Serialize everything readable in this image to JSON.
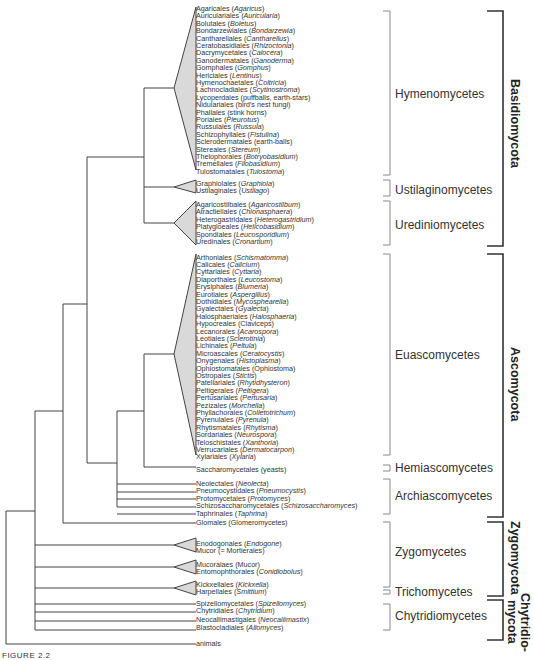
{
  "figure_label": "FIGURE 2.2",
  "colors": {
    "line": "#444444",
    "triangle_fill": "#d9d9d9",
    "bracket_light": "#888888",
    "bracket_dark": "#333333"
  },
  "taxa": [
    {
      "name": "Agaricales",
      "example": "Agaricus",
      "italic": true,
      "y": 9
    },
    {
      "name": "Auriculariales",
      "example": "Auricularia",
      "italic": true,
      "y": 16.4
    },
    {
      "name": "Bolutales",
      "example": "Boletus",
      "italic": true,
      "y": 23.8
    },
    {
      "name": "Bondarzewiales",
      "example": "Bondarzewia",
      "italic": true,
      "y": 31.2
    },
    {
      "name": "Cantharellales",
      "example": "Cantharellus",
      "italic": true,
      "y": 38.6
    },
    {
      "name": "Ceratobasidiales",
      "example": "Rhizoctonia",
      "italic": true,
      "y": 46
    },
    {
      "name": "Dacrymycetales",
      "example": "Calocera",
      "italic": true,
      "y": 53.4
    },
    {
      "name": "Ganodermatales",
      "example": "Ganoderma",
      "italic": true,
      "y": 60.8
    },
    {
      "name": "Gomphales",
      "example": "Gomphus",
      "italic": true,
      "y": 68.2
    },
    {
      "name": "Hericiales",
      "example": "Lentinus",
      "italic": true,
      "y": 75.6
    },
    {
      "name": "Hymenochaetales",
      "example": "Coltricia",
      "italic": true,
      "y": 83
    },
    {
      "name": "Lachnocladiales",
      "example": "Scytinostroma",
      "italic": true,
      "y": 90.4
    },
    {
      "name": "Lycoperdales",
      "example": "puffballs, earth-stars",
      "italic": false,
      "y": 97.8
    },
    {
      "name": "Nidulariales",
      "example": "bird's nest fungi",
      "italic": false,
      "y": 105.2
    },
    {
      "name": "Phallales",
      "example": "stink horns",
      "italic": false,
      "y": 112.6
    },
    {
      "name": "Poriales",
      "example": "Pleurotus",
      "italic": true,
      "y": 120
    },
    {
      "name": "Russulales",
      "example": "Russula",
      "italic": true,
      "y": 127.4
    },
    {
      "name": "Schizophyllales",
      "example": "Fistulina",
      "italic": true,
      "y": 134.8
    },
    {
      "name": "Sclerodermatales",
      "example": "earth-balls",
      "italic": false,
      "y": 142.2
    },
    {
      "name": "Stereales",
      "example": "Stereum",
      "italic": true,
      "y": 149.6
    },
    {
      "name": "Thelophorales",
      "example": "Botryobasidium",
      "italic": true,
      "y": 157
    },
    {
      "name": "Tremellales",
      "example": "Filobasidium",
      "italic": true,
      "y": 164.4
    },
    {
      "name": "Tulostomatales",
      "example": "Tulostoma",
      "italic": true,
      "y": 171.8
    },
    {
      "name": "Graphiolales",
      "example": "Graphiola",
      "italic": true,
      "y": 184
    },
    {
      "name": "Ustilaginales",
      "example": "Ustilago",
      "italic": true,
      "y": 191.4
    },
    {
      "name": "Agaricostilbales",
      "example": "Agaricostilbum",
      "italic": true,
      "y": 205
    },
    {
      "name": "Atractiellales",
      "example": "Chionasphaera",
      "italic": true,
      "y": 212.4
    },
    {
      "name": "Heterogastridales",
      "example": "Heterogastridium",
      "italic": true,
      "y": 219.8
    },
    {
      "name": "Platygloeales",
      "example": "Helicobasidium",
      "italic": true,
      "y": 227.2
    },
    {
      "name": "Spondiales",
      "example": "Leucosporidium",
      "italic": true,
      "y": 234.6
    },
    {
      "name": "Uredinales",
      "example": "Cronartium",
      "italic": true,
      "y": 242
    },
    {
      "name": "Arthoniales",
      "example": "Schismatomma",
      "italic": true,
      "y": 257.5
    },
    {
      "name": "Calicales",
      "example": "Calicium",
      "italic": true,
      "y": 264.9
    },
    {
      "name": "Cyttariales",
      "example": "Cyttaria",
      "italic": true,
      "y": 272.3
    },
    {
      "name": "Diaporthales",
      "example": "Leucostoma",
      "italic": true,
      "y": 279.7
    },
    {
      "name": "Erysiphales",
      "example": "Blumeria",
      "italic": true,
      "y": 287.1
    },
    {
      "name": "Eurotiales",
      "example": "Aspergillus",
      "italic": true,
      "y": 294.5
    },
    {
      "name": "Dothidiales",
      "example": "Mycosphearella",
      "italic": true,
      "y": 301.9
    },
    {
      "name": "Gyalectales",
      "example": "Gyalecta",
      "italic": true,
      "y": 309.3
    },
    {
      "name": "Halosphaeriales",
      "example": "Halosphaeria",
      "italic": true,
      "y": 316.7
    },
    {
      "name": "Hypocreales",
      "example": "Claviceps",
      "italic": false,
      "y": 324.1
    },
    {
      "name": "Lecanorales",
      "example": "Acarospora",
      "italic": true,
      "y": 331.5
    },
    {
      "name": "Leotiales",
      "example": "Sclerotinia",
      "italic": true,
      "y": 338.9
    },
    {
      "name": "Lichinales",
      "example": "Peltula",
      "italic": true,
      "y": 346.3
    },
    {
      "name": "Microascales",
      "example": "Ceratocystis",
      "italic": true,
      "y": 353.7
    },
    {
      "name": "Onygenales",
      "example": "Histoplasma",
      "italic": true,
      "y": 361.1
    },
    {
      "name": "Ophiostomatales",
      "example": "Ophiostoma",
      "italic": false,
      "y": 368.5
    },
    {
      "name": "Ostropales",
      "example": "Stictis",
      "italic": true,
      "y": 375.9
    },
    {
      "name": "Patellariales",
      "example": "Rhytidhysteron",
      "italic": true,
      "y": 383.3
    },
    {
      "name": "Peltigerales",
      "example": "Peltigera",
      "italic": true,
      "y": 390.7
    },
    {
      "name": "Pertusariales",
      "example": "Pertusaria",
      "italic": true,
      "y": 398.1
    },
    {
      "name": "Pezizales",
      "example": "Morchella",
      "italic": true,
      "y": 405.5
    },
    {
      "name": "Phyllachorales",
      "example": "Colletotrichum",
      "italic": true,
      "y": 412.9
    },
    {
      "name": "Pyrenulales",
      "example": "Pyrenula",
      "italic": true,
      "y": 420.3
    },
    {
      "name": "Rhytismatales",
      "example": "Rhytisma",
      "italic": true,
      "y": 427.7
    },
    {
      "name": "Sordariales",
      "example": "Neurospora",
      "italic": true,
      "y": 435.1
    },
    {
      "name": "Teloschistales",
      "example": "Xanthoria",
      "italic": true,
      "y": 442.5
    },
    {
      "name": "Verrucariales",
      "example": "Dermatocarpon",
      "italic": true,
      "y": 449.9
    },
    {
      "name": "Xylariales",
      "example": "Xylaria",
      "italic": true,
      "y": 457.3
    },
    {
      "name": "Saccharomycetales",
      "example": "yeasts",
      "italic": false,
      "y": 469.5
    },
    {
      "name": "Neolectales",
      "example": "Neolecta",
      "italic": true,
      "y": 484
    },
    {
      "name": "Pneumocystidales",
      "example": "Pneumocystis",
      "italic": true,
      "y": 491.4
    },
    {
      "name": "Protomycetales",
      "example": "Protomyces",
      "italic": true,
      "y": 498.8
    },
    {
      "name": "Schizosaccharomycetales",
      "example": "Schizosaccharomyces",
      "italic": true,
      "y": 506.2
    },
    {
      "name": "Taphrinales",
      "example": "Taphrina",
      "italic": true,
      "y": 513.6
    },
    {
      "name": "Glomales",
      "example": "Glomeromycetes",
      "italic": false,
      "y": 522.5
    },
    {
      "name": "Enodogonales",
      "example": "Endogone",
      "italic": true,
      "y": 543.5
    },
    {
      "name": "Mucor",
      "example": "= Mortierales",
      "italic": false,
      "y": 550.9
    },
    {
      "name": "Mucoralaes",
      "example": "Mucor",
      "italic": false,
      "y": 565
    },
    {
      "name": "Entomophthorales",
      "example": "Conidiobolus",
      "italic": true,
      "y": 572.4
    },
    {
      "name": "Kickxellales",
      "example": "Kickxella",
      "italic": true,
      "y": 585
    },
    {
      "name": "Harpellales",
      "example": "Smittium",
      "italic": true,
      "y": 592.4
    },
    {
      "name": "Spizellomycetales",
      "example": "Spizellomyces",
      "italic": true,
      "y": 603.5
    },
    {
      "name": "Chytridiales",
      "example": "Chytridium",
      "italic": true,
      "y": 611
    },
    {
      "name": "Neocallimastigales",
      "example": "Neocallimastix",
      "italic": true,
      "y": 619.5
    },
    {
      "name": "Blastocladiales",
      "example": "Allomyces",
      "italic": true,
      "y": 628
    },
    {
      "name": "animals",
      "example": null,
      "italic": false,
      "y": 644
    }
  ],
  "classes": [
    {
      "label": "Hymenomycetes",
      "y_top": 11,
      "y_bot": 175,
      "label_y": 88
    },
    {
      "label": "Ustilaginomycetes",
      "y_top": 180,
      "y_bot": 196,
      "label_y": 184
    },
    {
      "label": "Urediniomycetes",
      "y_top": 201,
      "y_bot": 246,
      "label_y": 219
    },
    {
      "label": "Euascomycetes",
      "y_top": 254,
      "y_bot": 461,
      "label_y": 349
    },
    {
      "label": "Hemiascomycetes",
      "y_top": 464,
      "y_bot": 471,
      "label_y": 462
    },
    {
      "label": "Archiascomycetes",
      "y_top": 479,
      "y_bot": 514,
      "label_y": 490
    },
    {
      "label": "Zygomycetes",
      "y_top": 522,
      "y_bot": 586,
      "label_y": 546
    },
    {
      "label": "Trichomycetes",
      "y_top": 589,
      "y_bot": 592,
      "label_y": 586
    },
    {
      "label": "Chytridiomycetes",
      "y_top": 603,
      "y_bot": 630,
      "label_y": 610
    }
  ],
  "phyla": [
    {
      "label": "Basidiomycota",
      "y_top": 11,
      "y_bot": 246
    },
    {
      "label": "Ascomycota",
      "y_top": 254,
      "y_bot": 516
    },
    {
      "label": "Zygomycota",
      "y_top": 522,
      "y_bot": 596
    },
    {
      "label": "Chytridio-",
      "label2": "mycota",
      "y_top": 600,
      "y_bot": 640
    }
  ]
}
